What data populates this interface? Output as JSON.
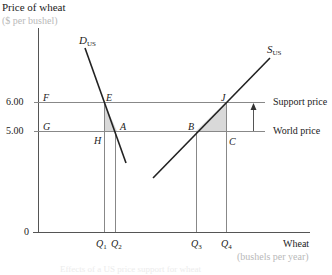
{
  "diagram": {
    "title": "Price of wheat",
    "y_unit": "($ per bushel)",
    "x_label": "Wheat",
    "x_unit": "(bushels per year)",
    "origin_label": "0",
    "y_ticks": [
      {
        "value": "6.00",
        "point_label": "F"
      },
      {
        "value": "5.00",
        "point_label": "G"
      }
    ],
    "curves": {
      "demand": {
        "label": "D",
        "sub": "US"
      },
      "supply": {
        "label": "S",
        "sub": "US"
      }
    },
    "points": {
      "E": "E",
      "A": "A",
      "H": "H",
      "J": "J",
      "B": "B",
      "C": "C"
    },
    "x_ticks": [
      {
        "label": "Q",
        "sub": "1"
      },
      {
        "label": "Q",
        "sub": "2"
      },
      {
        "label": "Q",
        "sub": "3"
      },
      {
        "label": "Q",
        "sub": "4"
      }
    ],
    "side_labels": {
      "support": "Support price",
      "world": "World price"
    },
    "shaded_fill": "#d9d9d9",
    "line_color": "#222222",
    "guide_color": "#888888",
    "caption": "Effects of a US price support for wheat"
  }
}
